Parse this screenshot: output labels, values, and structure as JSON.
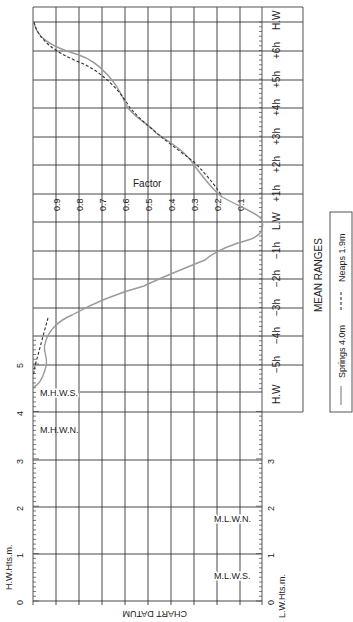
{
  "diagram": {
    "orientation": "rotated 90 degrees clockwise",
    "hw_height_axis_label": "H.W.Hts.m.",
    "lw_height_axis_label": "L.W.Hts.m.",
    "chart_datum_label": "CHART DATUM",
    "factor_label": "Factor",
    "level_labels": {
      "mhws": "M.H.W.S.",
      "mhwn": "M.H.W.N.",
      "mlwn": "M.L.W.N.",
      "mlws": "M.L.W.S."
    },
    "height_ticks": [
      "0",
      "1",
      "2",
      "3",
      "4",
      "5"
    ],
    "lw_height_ticks": [
      "0",
      "1",
      "2",
      "3"
    ],
    "factor_ticks": [
      "0.9",
      "0.8",
      "0.7",
      "0.6",
      "0.5",
      "0.4",
      "0.3",
      "0.2",
      "0.1"
    ],
    "time_labels": [
      "H.W",
      "+6h",
      "+5h",
      "+4h",
      "+3h",
      "+2h",
      "+1h",
      "L.W",
      "−1h",
      "−2h",
      "−3h",
      "−4h",
      "−5h",
      "H.W"
    ],
    "legend": {
      "title": "MEAN RANGES",
      "springs_label": "Springs 4.0m",
      "neaps_label": "Neaps 1.9m",
      "springs_color": "#9a9a9a",
      "neaps_color": "#333333"
    }
  },
  "chart_data": {
    "type": "line",
    "xlabel": "Time relative to L.W (hours)",
    "ylabel": "Factor",
    "x_tick_labels": [
      "H.W",
      "−5h",
      "−4h",
      "−3h",
      "−2h",
      "−1h",
      "L.W",
      "+1h",
      "+2h",
      "+3h",
      "+4h",
      "+5h",
      "+6h",
      "H.W"
    ],
    "ylim": [
      0,
      1
    ],
    "grid": true,
    "legend_position": "bottom-right (MEAN RANGES box)",
    "series": [
      {
        "name": "Springs 4.0m",
        "style": "solid grey",
        "points": [
          [
            -6.0,
            0.98
          ],
          [
            -5.5,
            0.96
          ],
          [
            -5.0,
            0.93
          ],
          [
            -4.0,
            0.97
          ],
          [
            -3.0,
            0.9
          ],
          [
            -2.5,
            0.78
          ],
          [
            -2.0,
            0.55
          ],
          [
            -1.5,
            0.28
          ],
          [
            -1.0,
            0.14
          ],
          [
            -0.5,
            0.04
          ],
          [
            0.0,
            0.0
          ],
          [
            0.5,
            0.05
          ],
          [
            1.0,
            0.2
          ],
          [
            2.0,
            0.33
          ],
          [
            3.0,
            0.4
          ],
          [
            3.5,
            0.45
          ],
          [
            4.0,
            0.52
          ],
          [
            4.5,
            0.6
          ],
          [
            5.0,
            0.78
          ],
          [
            5.5,
            0.9
          ],
          [
            6.0,
            0.98
          ],
          [
            6.3,
            1.0
          ]
        ]
      },
      {
        "name": "Neaps 1.9m",
        "style": "dashed dark",
        "points": [
          [
            -6.0,
            1.0
          ],
          [
            -5.0,
            0.97
          ],
          [
            -4.0,
            0.96
          ],
          [
            -3.0,
            0.9
          ],
          [
            1.0,
            0.2
          ],
          [
            2.0,
            0.3
          ],
          [
            3.0,
            0.4
          ],
          [
            4.0,
            0.5
          ],
          [
            5.0,
            0.7
          ],
          [
            5.5,
            0.85
          ],
          [
            6.0,
            0.95
          ],
          [
            6.3,
            1.0
          ]
        ]
      }
    ],
    "height_scale": {
      "hw_heights_m": [
        0,
        1,
        2,
        3,
        4,
        5
      ],
      "lw_heights_m": [
        0,
        1,
        2,
        3
      ],
      "levels": [
        "M.H.W.S.",
        "M.H.W.N.",
        "M.L.W.N.",
        "M.L.W.S."
      ]
    }
  }
}
